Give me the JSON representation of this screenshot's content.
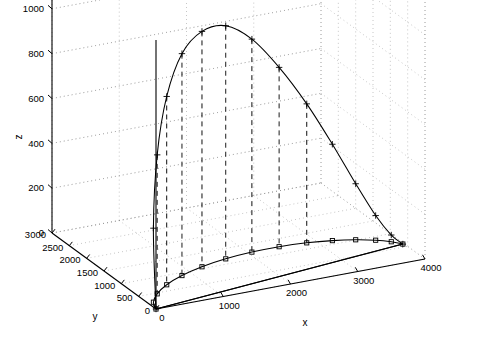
{
  "figure": {
    "title": "",
    "background_color": "#ffffff",
    "line_color": "#000000",
    "grid_color": "#808080"
  },
  "axes": {
    "x": {
      "label": "x",
      "ticks": [
        0,
        1000,
        2000,
        3000,
        4000
      ],
      "tick_labels": [
        "0",
        "1000",
        "2000",
        "3000",
        "4000"
      ],
      "range": [
        0,
        4000
      ]
    },
    "y": {
      "label": "y",
      "ticks": [
        0,
        500,
        1000,
        1500,
        2000,
        2500,
        3000
      ],
      "tick_labels": [
        "0",
        "500",
        "1000",
        "1500",
        "2000",
        "2500",
        "3000"
      ],
      "range": [
        0,
        3000
      ]
    },
    "z": {
      "label": "z",
      "ticks": [
        0,
        200,
        400,
        600,
        800,
        1000,
        1200
      ],
      "tick_labels": [
        "0",
        "200",
        "400",
        "600",
        "800",
        "1000",
        "1200"
      ],
      "range": [
        0,
        1200
      ]
    }
  },
  "chart_data": {
    "type": "line",
    "title": "",
    "xlabel": "x",
    "ylabel": "y",
    "zlabel": "z",
    "xlim": [
      0,
      4000
    ],
    "ylim": [
      0,
      3000
    ],
    "zlim": [
      0,
      1200
    ],
    "grid": true,
    "legend": "none",
    "projection": "3d",
    "view_azimuth_deg": -37.5,
    "view_elevation_deg": 30,
    "series": [
      {
        "name": "trajectory",
        "marker": "plus",
        "linestyle": "solid",
        "color": "#000000",
        "x": [
          0,
          80,
          260,
          520,
          850,
          1230,
          1640,
          2060,
          2470,
          2860,
          3200,
          3490,
          3720,
          3880,
          3980
        ],
        "y": [
          0,
          230,
          470,
          700,
          900,
          1060,
          1170,
          1230,
          1240,
          1200,
          1120,
          1010,
          880,
          740,
          600
        ],
        "z": [
          0,
          330,
          620,
          840,
          990,
          1050,
          1040,
          950,
          800,
          620,
          430,
          250,
          110,
          30,
          0
        ]
      },
      {
        "name": "ground-track",
        "marker": "square",
        "linestyle": "solid",
        "color": "#000000",
        "x": [
          0,
          80,
          260,
          520,
          850,
          1230,
          1640,
          2060,
          2470,
          2860,
          3200,
          3490,
          3720,
          3880,
          3980
        ],
        "y": [
          0,
          230,
          470,
          700,
          900,
          1060,
          1170,
          1230,
          1240,
          1200,
          1120,
          1010,
          880,
          740,
          600
        ],
        "z": [
          0,
          0,
          0,
          0,
          0,
          0,
          0,
          0,
          0,
          0,
          0,
          0,
          0,
          0,
          0
        ]
      }
    ],
    "drop_lines": {
      "description": "vertical dashed stems from trajectory points down to z=0",
      "style": "dashed",
      "indices": [
        3,
        5,
        7,
        9
      ]
    }
  }
}
